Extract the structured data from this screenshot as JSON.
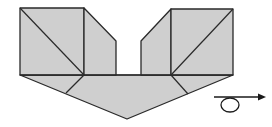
{
  "diagram": {
    "type": "origami-fold-step",
    "colors": {
      "paper_fill": "#cfcfcf",
      "stroke": "#2a2a2a",
      "background": "#ffffff"
    },
    "symbols": [
      {
        "name": "turn-over-arrow",
        "meaning": "turn the model over"
      }
    ]
  }
}
